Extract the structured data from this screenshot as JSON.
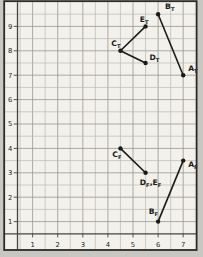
{
  "figure": {
    "kind": "graph-paper-plot",
    "page_background": "#c9c7c2",
    "paper_color": "#f3f1ec",
    "border_color": "#2b2a27",
    "heavy_line_color": "#45433f",
    "grid_minor_color": "#bcb9b1",
    "grid_major_color": "#9a978f",
    "ink_color": "#1b1a18",
    "axis_number_color": "#26251f"
  },
  "chart_data": {
    "type": "scatter",
    "title": "",
    "xlabel": "",
    "ylabel": "",
    "xlim": [
      0.4,
      7.55
    ],
    "ylim": [
      0.5,
      10.0
    ],
    "x_ticks": [
      1,
      2,
      3,
      4,
      5,
      6,
      7
    ],
    "y_ticks": [
      1,
      2,
      3,
      4,
      5,
      6,
      7,
      8,
      9
    ],
    "grid": {
      "on": true,
      "minor_step": 0.5,
      "major_step": 1
    },
    "points": [
      {
        "id": "BT",
        "parts": [
          [
            "B",
            "T"
          ]
        ],
        "x": 6,
        "y": 9.5,
        "anchor": "start",
        "dx": 7,
        "dy": -5
      },
      {
        "id": "ET",
        "parts": [
          [
            "E",
            "T"
          ]
        ],
        "x": 5.5,
        "y": 9,
        "anchor": "end",
        "dx": 3,
        "dy": -4
      },
      {
        "id": "CT",
        "parts": [
          [
            "C",
            "T"
          ]
        ],
        "x": 4.5,
        "y": 8,
        "anchor": "end",
        "dx": 0,
        "dy": -5
      },
      {
        "id": "DT",
        "parts": [
          [
            "D",
            "T"
          ]
        ],
        "x": 5.5,
        "y": 7.5,
        "anchor": "start",
        "dx": 4,
        "dy": -3
      },
      {
        "id": "AT",
        "parts": [
          [
            "A",
            "T"
          ]
        ],
        "x": 7,
        "y": 7,
        "anchor": "start",
        "dx": 5,
        "dy": -4
      },
      {
        "id": "CF",
        "parts": [
          [
            "C",
            "F"
          ]
        ],
        "x": 4.5,
        "y": 4,
        "anchor": "end",
        "dx": 1,
        "dy": 9
      },
      {
        "id": "DEF",
        "parts": [
          [
            "D",
            "F"
          ],
          [
            "E",
            "F"
          ]
        ],
        "x": 5.5,
        "y": 3,
        "anchor": "middle",
        "dx": 5,
        "dy": 12
      },
      {
        "id": "AF",
        "parts": [
          [
            "A",
            "F"
          ]
        ],
        "x": 7,
        "y": 3.5,
        "anchor": "start",
        "dx": 5,
        "dy": 6
      },
      {
        "id": "BF",
        "parts": [
          [
            "B",
            "F"
          ]
        ],
        "x": 6,
        "y": 1,
        "anchor": "end",
        "dx": 0,
        "dy": -8
      }
    ],
    "segments": [
      [
        "BT",
        "AT"
      ],
      [
        "CT",
        "ET"
      ],
      [
        "CT",
        "DT"
      ],
      [
        "CF",
        "DEF"
      ],
      [
        "BF",
        "AF"
      ]
    ]
  }
}
